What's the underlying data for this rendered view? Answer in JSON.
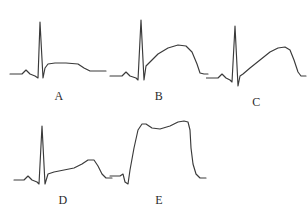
{
  "figure": {
    "kind": "ecg-waveform-figure",
    "background_color": "#ffffff",
    "trace_color": "#3a3a3a",
    "label_color": "#2b2b2b",
    "panel_count": 5
  },
  "panels": [
    {
      "id": "a",
      "label": "A",
      "morphology": "Sharp tall R wave with flat/horizontal elevated ST plateau that steps down to baseline; no distinct T-wave dome.",
      "path": "M 2,66 L 14,66 L 18,62 L 22,66 L 27,68 L 30,70 L 32,14 L 35,70 L 37,60 L 40,56 L 47,55 L 58,55 L 70,56 L 76,60 L 82,63 L 98,63"
    },
    {
      "id": "b",
      "label": "B",
      "morphology": "Sharp tall R wave; ST segment rises convexly into a broad rounded dome (T wave fused), then descends to baseline.",
      "path": "M 2,68 L 14,68 L 18,64 L 22,68 L 28,70 L 30,72 L 33,12 L 36,72 L 38,58 L 42,54 L 50,46 L 60,40 L 70,37 L 78,38 L 84,44 L 89,56 L 92,65 L 96,66 L 100,66"
    },
    {
      "id": "c",
      "label": "C",
      "morphology": "Sharp tall R wave with deep S; concave upward-sloping ST segment rising to a late rounded peak, then a steep drop to baseline.",
      "path": "M 0,66 L 12,66 L 16,62 L 20,66 L 24,68 L 26,70 L 29,14 L 32,74 L 34,64 L 37,62 L 44,56 L 54,48 L 64,40 L 72,36 L 79,35 L 84,38 L 88,48 L 92,60 L 95,64 L 100,64"
    },
    {
      "id": "d",
      "label": "D",
      "morphology": "Sharp tall R wave; long slowly-rising ST segment with a small late rounded hump (T wave), then a drop to a low terminal baseline.",
      "path": "M 2,68 L 12,68 L 16,64 L 20,68 L 25,70 L 27,72 L 30,14 L 33,72 L 36,62 L 42,60 L 52,58 L 62,56 L 70,52 L 76,48 L 82,48 L 86,54 L 90,62 L 94,66 L 100,66"
    },
    {
      "id": "e",
      "label": "E",
      "morphology": "Giant square 'tombstone' ST elevation: no discrete R peak, near-vertical upstroke to a very wide high plateau with a shallow mid dip, then a steep near-vertical descent to baseline.",
      "path": "M 2,68 L 12,68 L 15,66 L 17,74 L 20,76 L 22,62 L 26,40 L 30,22 L 34,16 L 38,16 L 44,20 L 52,21 L 62,18 L 70,14 L 76,13 L 80,14 L 82,22 L 83,40 L 85,56 L 88,66 L 92,70 L 98,70"
    }
  ]
}
